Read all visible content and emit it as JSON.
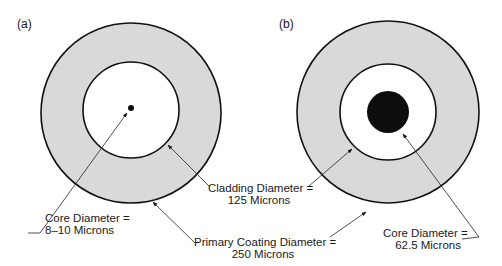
{
  "panels": [
    {
      "id": "a",
      "tag": "(a)",
      "core_label": {
        "line1": "Core Diameter =",
        "line2": "8–10 Microns"
      }
    },
    {
      "id": "b",
      "tag": "(b)",
      "core_label": {
        "line1": "Core Diameter =",
        "line2": "62.5 Microns"
      }
    }
  ],
  "shared_labels": {
    "cladding": {
      "line1": "Cladding Diameter =",
      "line2": "125 Microns"
    },
    "coating": {
      "line1": "Primary Coating Diameter =",
      "line2": "250 Microns"
    }
  },
  "colors": {
    "coating_fill": "#d9d9d9",
    "cladding_fill": "#ffffff",
    "core_fill": "#0d0d0d",
    "stroke": "#111111"
  }
}
